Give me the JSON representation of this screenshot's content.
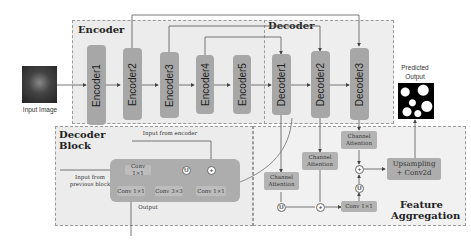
{
  "diagram": {
    "input": {
      "label": "Input Image"
    },
    "output": {
      "label_line1": "Predicted",
      "label_line2": "Output"
    },
    "encoder": {
      "title": "Encoder",
      "blocks": [
        "Encoder1",
        "Encoder2",
        "Encoder3",
        "Encoder4",
        "Encoder5"
      ]
    },
    "decoder": {
      "title": "Decoder",
      "blocks": [
        "Decoder1",
        "Decoder2",
        "Decoder3"
      ]
    },
    "decoder_block": {
      "title_line1": "Decoder",
      "title_line2": "Block",
      "input_from_encoder": "Input from encoder",
      "input_from_previous_line1": "Input from",
      "input_from_previous_line2": "previous block",
      "output_label": "Output",
      "top_conv": "Conv 1×1",
      "upsample_symbol": "U",
      "concat_symbol": "+",
      "bottom_convs": [
        "Conv 1×1",
        "Conv 3×3",
        "Conv 1×1"
      ]
    },
    "feature_aggregation": {
      "title_line1": "Feature",
      "title_line2": "Aggregation",
      "channel_attention_1_line1": "Channel",
      "channel_attention_1_line2": "Attention",
      "channel_attention_2_line1": "Channel",
      "channel_attention_2_line2": "Attention",
      "channel_attention_3_line1": "Channel",
      "channel_attention_3_line2": "Attention",
      "upsample_symbol": "U",
      "add_symbol": "+",
      "conv": "Conv 1×1",
      "upsampling_line1": "Upsampling",
      "upsampling_line2": "+ Conv2d"
    },
    "colors": {
      "block_fill": "#a7a7a7",
      "region_fill": "#ececec",
      "line": "#555555"
    }
  }
}
